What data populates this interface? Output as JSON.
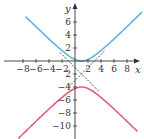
{
  "chart_data": {
    "type": "line",
    "title": "",
    "xlabel": "x",
    "ylabel": "y",
    "xlim": [
      -9.5,
      10.5
    ],
    "ylim": [
      -11.8,
      9.4
    ],
    "grid": false,
    "legend": null,
    "x_ticks": [
      -8,
      -6,
      -4,
      -2,
      2,
      4,
      6,
      8
    ],
    "x_tick_labels": [
      "−8",
      "−6",
      "−4",
      "−2",
      "2",
      "4",
      "6",
      "8"
    ],
    "y_ticks": [
      6,
      4,
      2,
      -2,
      -4,
      -6,
      -8,
      -10
    ],
    "y_tick_labels": [
      "6",
      "4",
      "2",
      "2",
      "−4",
      "−6",
      "−8",
      "−10"
    ],
    "equation": "(y+2)^2/4 - (x-1)^2/4 = 1",
    "center": [
      1,
      -2
    ],
    "vertices": [
      [
        1,
        0
      ],
      [
        1,
        -4
      ]
    ],
    "series": [
      {
        "name": "upper branch",
        "color": "#5bb8d8",
        "x": [
          -7.6,
          -6,
          -4,
          -2,
          -1,
          0,
          1,
          2,
          3,
          4,
          6,
          8,
          10.3
        ],
        "y": [
          6.8,
          5.28,
          3.39,
          1.61,
          0.83,
          0.24,
          0.0,
          0.24,
          0.83,
          1.61,
          3.39,
          5.28,
          7.5
        ]
      },
      {
        "name": "lower branch",
        "color": "#e0607e",
        "x": [
          -8.7,
          -6,
          -4,
          -2,
          -1,
          0,
          1,
          2,
          3,
          4,
          6,
          8,
          9.6
        ],
        "y": [
          -11.9,
          -9.28,
          -7.39,
          -5.61,
          -4.83,
          -4.24,
          -4.0,
          -4.24,
          -4.83,
          -5.61,
          -7.39,
          -9.28,
          -10.8
        ]
      },
      {
        "name": "asymptote y = x - 3",
        "style": "dashed",
        "color": "#222222",
        "x": [
          -1,
          4.5
        ],
        "y": [
          -4,
          1.5
        ]
      },
      {
        "name": "asymptote y = -x - 1",
        "style": "dashed",
        "color": "#222222",
        "x": [
          -2.3,
          3.7
        ],
        "y": [
          1.3,
          -4.7
        ]
      }
    ]
  },
  "colors": {
    "upper": "#5bb8d8",
    "lower": "#e0607e",
    "axis": "#333333",
    "asymptote": "#222222"
  }
}
